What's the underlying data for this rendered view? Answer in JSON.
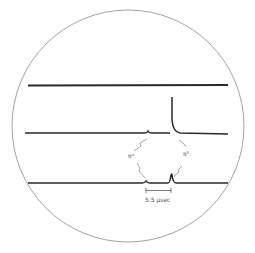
{
  "figure": {
    "type": "oscilloscope-traces",
    "traces": [
      {
        "name": "top-trace",
        "baseline_y": 85,
        "features": []
      },
      {
        "name": "middle-trace",
        "baseline_y": 133,
        "features": [
          {
            "kind": "small-bump",
            "x": 148
          },
          {
            "kind": "large-spike",
            "x": 171
          }
        ]
      },
      {
        "name": "bottom-trace",
        "baseline_y": 183,
        "features": [
          {
            "kind": "small-bump",
            "x": 145
          },
          {
            "kind": "spike",
            "x": 171
          }
        ]
      }
    ],
    "labels": {
      "left_particle": "π⁺",
      "right_particle": "π°",
      "scale_bar": "5.5 μsec"
    },
    "colors": {
      "trace": "#2a2a2a",
      "circle": "#8a8a8a",
      "background": "#ffffff"
    }
  }
}
